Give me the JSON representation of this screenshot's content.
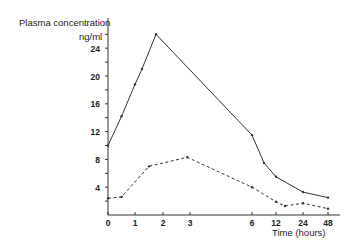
{
  "chart_data": {
    "type": "line",
    "title": "",
    "ylabel_line1": "Plasma concentration",
    "ylabel_line2": "ng/ml",
    "xlabel": "Time (hours)",
    "ylim": [
      0,
      27
    ],
    "yticks": [
      4,
      8,
      12,
      16,
      20,
      24
    ],
    "ytick_labels": [
      "4",
      "8",
      "12",
      "16",
      "20",
      "24"
    ],
    "xticks": [
      0,
      1,
      2,
      3,
      6,
      12,
      24,
      48
    ],
    "xtick_labels": [
      "0",
      "1",
      "2",
      "3",
      "6",
      "12",
      "24",
      "48"
    ],
    "x_scale_note": "non-linear time axis",
    "grid": false,
    "legend": null,
    "series": [
      {
        "name": "solid",
        "style": "solid",
        "x": [
          0,
          0.5,
          1,
          1.25,
          1.75,
          6,
          9,
          12,
          24,
          48
        ],
        "y": [
          10,
          14.2,
          18.8,
          21,
          26,
          11.5,
          7.5,
          5.5,
          3.3,
          2.5
        ]
      },
      {
        "name": "dashed",
        "style": "dashed",
        "x": [
          0,
          0.5,
          1.5,
          2.9,
          6,
          12,
          16,
          24,
          48
        ],
        "y": [
          2.4,
          2.6,
          7,
          8.3,
          4,
          1.9,
          1.3,
          1.7,
          0.9
        ]
      }
    ]
  }
}
